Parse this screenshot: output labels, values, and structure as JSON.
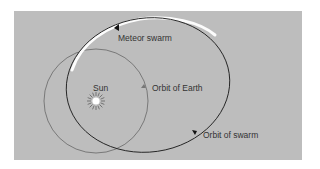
{
  "diagram": {
    "labels": {
      "meteor_swarm": "Meteor swarm",
      "sun": "Sun",
      "orbit_earth": "Orbit of Earth",
      "orbit_swarm": "Orbit of swarm"
    },
    "colors": {
      "background": "#bdbdbd",
      "earth_orbit": "#6e6e6e",
      "swarm_orbit": "#1e1e1e",
      "swarm_highlight": "#ffffff",
      "sun": "#ffffff",
      "text": "#333333"
    }
  }
}
